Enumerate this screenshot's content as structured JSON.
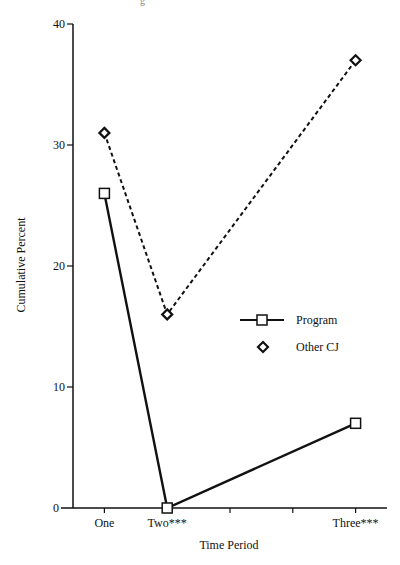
{
  "page": {
    "top_fragment": "g"
  },
  "chart_data": {
    "type": "line",
    "title": "",
    "xlabel": "Time Period",
    "ylabel": "Cumulative Percent",
    "x_ticks": [
      {
        "pos": 1,
        "label": "One"
      },
      {
        "pos": 2,
        "label": "Two***"
      },
      {
        "pos": 3,
        "label": ""
      },
      {
        "pos": 4,
        "label": ""
      },
      {
        "pos": 5,
        "label": "Three***"
      }
    ],
    "xlim": [
      0.5,
      5.5
    ],
    "ylim": [
      0,
      40
    ],
    "y_ticks": [
      0,
      10,
      20,
      30,
      40
    ],
    "grid": false,
    "legend_position": "center-right",
    "series": [
      {
        "name": "Program",
        "marker": "square",
        "line_style": "solid",
        "color": "#111111",
        "points": [
          {
            "x": 1,
            "label": "One",
            "y": 26
          },
          {
            "x": 2,
            "label": "Two***",
            "y": 0
          },
          {
            "x": 5,
            "label": "Three***",
            "y": 7
          }
        ]
      },
      {
        "name": "Other CJ",
        "marker": "diamond",
        "line_style": "dashed",
        "color": "#111111",
        "points": [
          {
            "x": 1,
            "label": "One",
            "y": 31
          },
          {
            "x": 2,
            "label": "Two***",
            "y": 16
          },
          {
            "x": 5,
            "label": "Three***",
            "y": 37
          }
        ]
      }
    ]
  }
}
